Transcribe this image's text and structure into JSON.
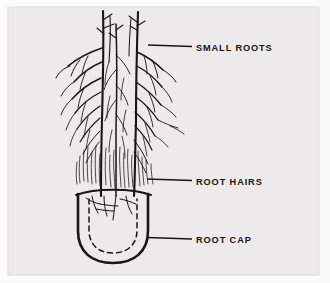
{
  "figure": {
    "name": "root-tip-diagram",
    "background_color": "#eceaea",
    "margin_color": "#fbfbfb",
    "frame_color": "#dedcdc",
    "ink_color": "#161616",
    "labels": [
      {
        "id": "small-roots",
        "text": "SMALL ROOTS",
        "text_x": 196,
        "text_y": 51,
        "leader": {
          "x1": 148,
          "y1": 45,
          "x2": 192,
          "y2": 47
        }
      },
      {
        "id": "root-hairs",
        "text": "ROOT HAIRS",
        "text_x": 196,
        "text_y": 185,
        "leader": {
          "x1": 148,
          "y1": 179,
          "x2": 192,
          "y2": 181
        }
      },
      {
        "id": "root-cap",
        "text": "ROOT CAP",
        "text_x": 196,
        "text_y": 243,
        "leader": {
          "x1": 148,
          "y1": 238,
          "x2": 192,
          "y2": 239
        }
      }
    ],
    "root_cap": {
      "outer_outline": "M 78 195 L 78 232 Q 78 262 113 262 Q 148 262 148 232 L 148 195",
      "inner_dashed_outline": "M 88 199 L 88 231 Q 88 252 113 252 Q 138 252 138 231 L 138 199",
      "dash_pattern": "5 4",
      "collar_line": "M 76 194 Q 113 186 150 194"
    },
    "taproot_stems": [
      "M 104 10 L 104 60 L 103 110 L 102 160 L 101 196",
      "M 138 12 L 137 60 L 136 110 L 135 160 L 134 196",
      "M 118 20 L 117 70 L 117 120 L 116 170 L 116 196"
    ],
    "root_hair_band": {
      "top": 150,
      "bottom": 196,
      "left": 76,
      "right": 152
    }
  }
}
